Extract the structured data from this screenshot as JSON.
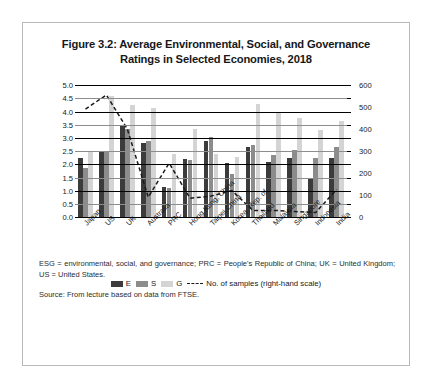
{
  "figure": {
    "title": "Figure 3.2: Average Environmental, Social, and Governance Ratings in Selected Economies, 2018",
    "title_line1": "Figure 3.2: Average Environmental, Social, and Governance",
    "title_line2": "Ratings in Selected Economies, 2018"
  },
  "notes": {
    "abbreviations": "ESG = environmental, social, and governance; PRC = People's Republic of China; UK = United Kingdom; US = United States.",
    "source": "Source: From lecture based on data from FTSE."
  },
  "colors": {
    "e": "#3b3b3b",
    "s": "#8c8c8c",
    "g": "#d4d4d4",
    "line": "#1b1b1b",
    "frame": "#b9b9b9",
    "gridline": "#000000"
  },
  "chart_data": {
    "type": "bar",
    "title": "Figure 3.2: Average Environmental, Social, and Governance Ratings in Selected Economies, 2018",
    "xlabel": "",
    "ylabel": "",
    "ylabel_right": "No. of samples",
    "grid": true,
    "legend_position": "bottom",
    "ylim": [
      0,
      5
    ],
    "yticks": [
      "0.0",
      "0.5",
      "1.0",
      "1.5",
      "2.0",
      "2.5",
      "3.0",
      "3.5",
      "4.0",
      "4.5",
      "5.0"
    ],
    "ylim_right": [
      0,
      600
    ],
    "yticks_right": [
      "0",
      "100",
      "200",
      "300",
      "400",
      "500",
      "600"
    ],
    "categories": [
      "Japan",
      "US",
      "UK",
      "Australia",
      "PRC",
      "Hong Kong, China",
      "Taipei,China",
      "Korea, Rep. of",
      "Thailand",
      "Malaysia",
      "Singapore",
      "Indonesia",
      "India"
    ],
    "series": [
      {
        "name": "E",
        "type": "bar",
        "axis": "left",
        "color": "#3b3b3b",
        "values": [
          2.25,
          2.5,
          3.5,
          2.8,
          1.15,
          2.2,
          2.9,
          2.05,
          2.65,
          2.1,
          2.25,
          1.45,
          2.25
        ]
      },
      {
        "name": "S",
        "type": "bar",
        "axis": "left",
        "color": "#8c8c8c",
        "values": [
          1.85,
          2.5,
          3.35,
          2.9,
          1.1,
          2.15,
          3.05,
          1.65,
          2.75,
          2.35,
          2.55,
          2.25,
          2.65
        ]
      },
      {
        "name": "G",
        "type": "bar",
        "axis": "left",
        "color": "#d4d4d4",
        "values": [
          2.5,
          4.6,
          4.25,
          4.15,
          2.4,
          3.35,
          2.4,
          2.3,
          4.3,
          4.0,
          3.75,
          3.3,
          3.65
        ]
      },
      {
        "name": "No. of samples (right-hand scale)",
        "type": "line",
        "style": "dashed",
        "axis": "right",
        "color": "#1b1b1b",
        "values": [
          490,
          555,
          400,
          90,
          245,
          85,
          95,
          120,
          30,
          30,
          25,
          20,
          125
        ]
      }
    ]
  },
  "legend": {
    "items": [
      {
        "label": "E",
        "kind": "swatch"
      },
      {
        "label": "S",
        "kind": "swatch"
      },
      {
        "label": "G",
        "kind": "swatch"
      },
      {
        "label": "No. of samples (right-hand scale)",
        "kind": "dashed-line"
      }
    ]
  }
}
